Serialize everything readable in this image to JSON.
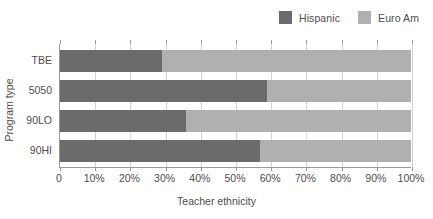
{
  "chart_data": {
    "type": "bar",
    "orientation": "horizontal",
    "stacked": true,
    "normalized": true,
    "title": "",
    "xlabel": "Teacher ethnicity",
    "ylabel": "Program type",
    "xlim": [
      0,
      100
    ],
    "xticks": [
      "0",
      "10%",
      "20%",
      "30%",
      "40%",
      "50%",
      "60%",
      "70%",
      "80%",
      "90%",
      "100%"
    ],
    "xtick_values": [
      0,
      10,
      20,
      30,
      40,
      50,
      60,
      70,
      80,
      90,
      100
    ],
    "grid": "vertical",
    "legend_position": "top-right",
    "categories": [
      "TBE",
      "5050",
      "90LO",
      "90HI"
    ],
    "series": [
      {
        "name": "Hispanic",
        "color": "#6b6b6b",
        "values": [
          29,
          59,
          36,
          57
        ]
      },
      {
        "name": "Euro Am",
        "color": "#b0b0b0",
        "values": [
          71,
          41,
          64,
          43
        ]
      }
    ]
  },
  "legend": {
    "entries": [
      {
        "label": "Hispanic",
        "color": "#6b6b6b"
      },
      {
        "label": "Euro Am",
        "color": "#b0b0b0"
      }
    ]
  },
  "axes": {
    "x_title": "Teacher ethnicity",
    "y_title": "Program type",
    "y_categories": [
      "TBE",
      "5050",
      "90LO",
      "90HI"
    ],
    "x_tick_labels": [
      "0",
      "10%",
      "20%",
      "30%",
      "40%",
      "50%",
      "60%",
      "70%",
      "80%",
      "90%",
      "100%"
    ]
  },
  "colors": {
    "hispanic": "#6b6b6b",
    "euro_am": "#b0b0b0",
    "axis": "#9a9a9a",
    "gridline": "#d3d3d3",
    "text": "#4d4d4d",
    "background": "#ffffff"
  }
}
